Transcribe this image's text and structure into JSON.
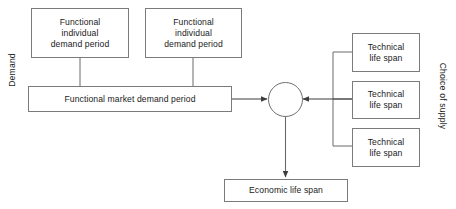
{
  "diagram": {
    "background_color": "#ffffff",
    "stroke_color": "#7b7b7b",
    "edge_color": "#4a4a4a",
    "text_color": "#1a1a1a",
    "axis_labels": {
      "left": "Demand",
      "right": "Choice of supply"
    },
    "nodes": {
      "functional_individual_demand_1": {
        "line1": "Functional",
        "line2": "individual",
        "line3": "demand period"
      },
      "functional_individual_demand_2": {
        "line1": "Functional",
        "line2": "individual",
        "line3": "demand period"
      },
      "functional_market_demand": {
        "label": "Functional market demand period"
      },
      "technical_life_span_1": {
        "line1": "Technical",
        "line2": "life span"
      },
      "technical_life_span_2": {
        "line1": "Technical",
        "line2": "life span"
      },
      "technical_life_span_3": {
        "line1": "Technical",
        "line2": "life span"
      },
      "junction": {
        "label": ""
      },
      "economic_life_span": {
        "label": "Economic life span"
      }
    },
    "edges": [
      {
        "from": "functional_individual_demand_1",
        "to": "functional_market_demand",
        "arrow": false
      },
      {
        "from": "functional_individual_demand_2",
        "to": "functional_market_demand",
        "arrow": false
      },
      {
        "from": "functional_market_demand",
        "to": "junction",
        "arrow": true
      },
      {
        "from": "technical_life_span_1",
        "to": "junction",
        "arrow": true
      },
      {
        "from": "technical_life_span_2",
        "to": "junction",
        "arrow": true
      },
      {
        "from": "technical_life_span_3",
        "to": "junction",
        "arrow": true
      },
      {
        "from": "junction",
        "to": "economic_life_span",
        "arrow": true
      }
    ]
  }
}
